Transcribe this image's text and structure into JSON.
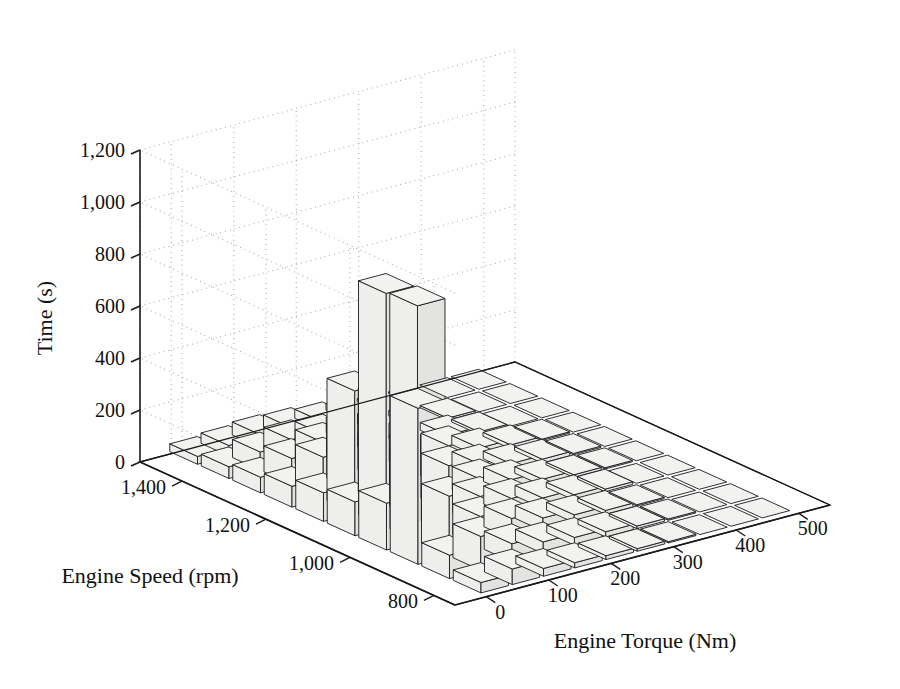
{
  "chart_data": {
    "type": "bar",
    "subtype": "bar3-histogram-3d",
    "title": "",
    "xlabel": "Engine Torque (Nm)",
    "ylabel": "Engine Speed (rpm)",
    "zlabel": "Time (s)",
    "xlim": [
      -50,
      550
    ],
    "ylim": [
      750,
      1500
    ],
    "zlim": [
      0,
      1200
    ],
    "xticks": [
      0,
      100,
      200,
      300,
      400,
      500
    ],
    "xticklabels": [
      "0",
      "100",
      "200",
      "300",
      "400",
      "500"
    ],
    "yticks": [
      800,
      1000,
      1200,
      1400
    ],
    "yticklabels": [
      "800",
      "1,000",
      "1,200",
      "1,400"
    ],
    "zticks": [
      0,
      200,
      400,
      600,
      800,
      1000,
      1200
    ],
    "zticklabels": [
      "0",
      "200",
      "400",
      "600",
      "800",
      "1,000",
      "1,200"
    ],
    "grid": true,
    "gridstyle": "dotted",
    "legend": null,
    "bar_facecolor": "#f2f2f0",
    "bar_edgecolor": "#1a1a1a",
    "axis_color": "#1a1a1a",
    "x_bin_centers": [
      25,
      75,
      125,
      175,
      225,
      275,
      325,
      375,
      425,
      475
    ],
    "y_bin_centers": [
      800,
      875,
      950,
      1025,
      1100,
      1175,
      1250,
      1325,
      1400,
      1475
    ],
    "z_matrix_note": "rows = engine speed bins (800 -> 1475), cols = engine torque bins (25 -> 475); values in seconds",
    "z_matrix": [
      [
        40,
        60,
        30,
        20,
        15,
        10,
        5,
        0,
        0,
        0
      ],
      [
        90,
        130,
        70,
        45,
        30,
        20,
        10,
        5,
        0,
        0
      ],
      [
        600,
        230,
        120,
        80,
        50,
        30,
        15,
        5,
        0,
        0
      ],
      [
        180,
        310,
        260,
        110,
        70,
        40,
        20,
        10,
        0,
        0
      ],
      [
        130,
        900,
        820,
        250,
        90,
        55,
        25,
        10,
        5,
        0
      ],
      [
        110,
        470,
        400,
        190,
        150,
        60,
        30,
        15,
        5,
        0
      ],
      [
        80,
        160,
        210,
        140,
        100,
        70,
        35,
        15,
        5,
        0
      ],
      [
        60,
        100,
        130,
        120,
        90,
        60,
        30,
        10,
        0,
        0
      ],
      [
        45,
        70,
        85,
        75,
        60,
        40,
        20,
        8,
        0,
        0
      ],
      [
        30,
        40,
        50,
        45,
        35,
        25,
        12,
        5,
        0,
        0
      ]
    ],
    "notable_bars": [
      {
        "torque": 75,
        "speed": 1100,
        "time": 900
      },
      {
        "torque": 125,
        "speed": 1100,
        "time": 820
      },
      {
        "torque": 25,
        "speed": 950,
        "time": 600
      },
      {
        "torque": 75,
        "speed": 1175,
        "time": 470
      },
      {
        "torque": 125,
        "speed": 1175,
        "time": 400
      },
      {
        "torque": 75,
        "speed": 1025,
        "time": 310
      }
    ],
    "max_value": 900,
    "min_value": 0
  },
  "axes": {
    "z": {
      "title": "Time (s)",
      "labels": [
        "1,200",
        "1,000",
        "800",
        "600",
        "400",
        "200",
        "0"
      ]
    },
    "y": {
      "title": "Engine Speed (rpm)",
      "labels": [
        "1,400",
        "1,200",
        "1,000",
        "800"
      ]
    },
    "x": {
      "title": "Engine Torque (Nm)",
      "labels": [
        "0",
        "100",
        "200",
        "300",
        "400",
        "500"
      ]
    }
  }
}
